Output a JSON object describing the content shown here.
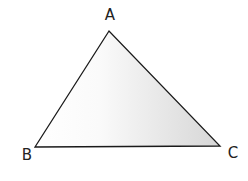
{
  "diagram": {
    "type": "triangle",
    "stroke_color": "#1a1a1a",
    "fill_light": "#ffffff",
    "fill_dark": "#d9d9d9",
    "vertices": [
      {
        "label": "A",
        "x": 109,
        "y": 31,
        "label_x": 110,
        "label_y": 20
      },
      {
        "label": "B",
        "x": 35,
        "y": 147,
        "label_x": 27,
        "label_y": 160
      },
      {
        "label": "C",
        "x": 220,
        "y": 146,
        "label_x": 233,
        "label_y": 158
      }
    ]
  }
}
